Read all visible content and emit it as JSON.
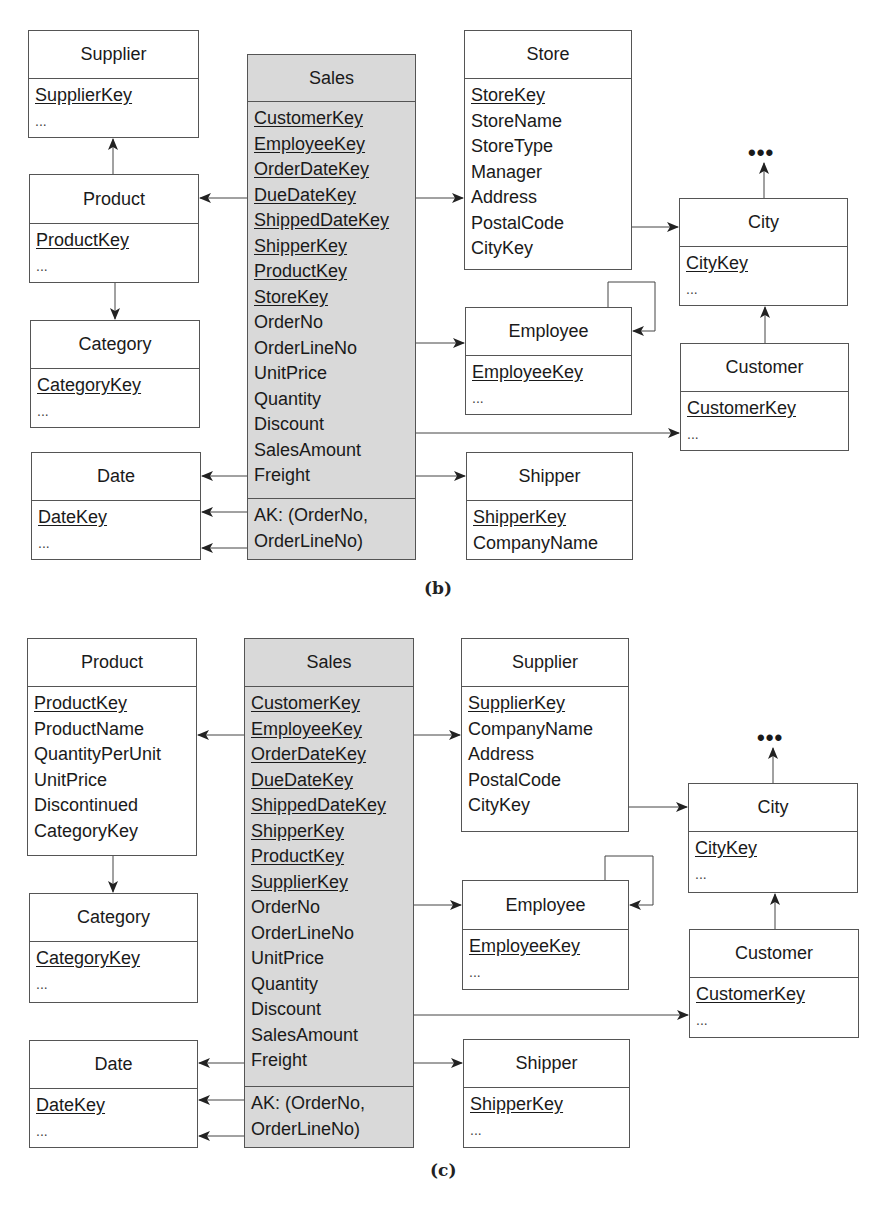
{
  "diagrams": {
    "b": {
      "caption": "(b)",
      "tables": {
        "supplier": {
          "name": "Supplier",
          "attributes": [
            {
              "text": "SupplierKey",
              "key": true
            },
            {
              "text": "...",
              "key": false
            }
          ]
        },
        "product": {
          "name": "Product",
          "attributes": [
            {
              "text": "ProductKey",
              "key": true
            },
            {
              "text": "...",
              "key": false
            }
          ]
        },
        "category": {
          "name": "Category",
          "attributes": [
            {
              "text": "CategoryKey",
              "key": true
            },
            {
              "text": "...",
              "key": false
            }
          ]
        },
        "date": {
          "name": "Date",
          "attributes": [
            {
              "text": "DateKey",
              "key": true
            },
            {
              "text": "...",
              "key": false
            }
          ]
        },
        "sales": {
          "name": "Sales",
          "attributes": [
            {
              "text": "CustomerKey",
              "key": true
            },
            {
              "text": "EmployeeKey",
              "key": true
            },
            {
              "text": "OrderDateKey",
              "key": true
            },
            {
              "text": "DueDateKey",
              "key": true
            },
            {
              "text": "ShippedDateKey",
              "key": true
            },
            {
              "text": "ShipperKey",
              "key": true
            },
            {
              "text": "ProductKey",
              "key": true
            },
            {
              "text": "StoreKey",
              "key": true
            },
            {
              "text": "OrderNo",
              "key": false
            },
            {
              "text": "OrderLineNo",
              "key": false
            },
            {
              "text": "UnitPrice",
              "key": false
            },
            {
              "text": "Quantity",
              "key": false
            },
            {
              "text": "Discount",
              "key": false
            },
            {
              "text": "SalesAmount",
              "key": false
            },
            {
              "text": "Freight",
              "key": false
            }
          ],
          "alternate_key": [
            "AK: (OrderNo,",
            "OrderLineNo)"
          ]
        },
        "store": {
          "name": "Store",
          "attributes": [
            {
              "text": "StoreKey",
              "key": true
            },
            {
              "text": "StoreName",
              "key": false
            },
            {
              "text": "StoreType",
              "key": false
            },
            {
              "text": "Manager",
              "key": false
            },
            {
              "text": "Address",
              "key": false
            },
            {
              "text": "PostalCode",
              "key": false
            },
            {
              "text": "CityKey",
              "key": false
            }
          ]
        },
        "city": {
          "name": "City",
          "attributes": [
            {
              "text": "CityKey",
              "key": true
            },
            {
              "text": "...",
              "key": false
            }
          ]
        },
        "employee": {
          "name": "Employee",
          "attributes": [
            {
              "text": "EmployeeKey",
              "key": true
            },
            {
              "text": "...",
              "key": false
            }
          ]
        },
        "customer": {
          "name": "Customer",
          "attributes": [
            {
              "text": "CustomerKey",
              "key": true
            },
            {
              "text": "...",
              "key": false
            }
          ]
        },
        "shipper": {
          "name": "Shipper",
          "attributes": [
            {
              "text": "ShipperKey",
              "key": true
            },
            {
              "text": "CompanyName",
              "key": false
            }
          ]
        }
      },
      "continuation": "•••"
    },
    "c": {
      "caption": "(c)",
      "tables": {
        "product": {
          "name": "Product",
          "attributes": [
            {
              "text": "ProductKey",
              "key": true
            },
            {
              "text": "ProductName",
              "key": false
            },
            {
              "text": "QuantityPerUnit",
              "key": false
            },
            {
              "text": "UnitPrice",
              "key": false
            },
            {
              "text": "Discontinued",
              "key": false
            },
            {
              "text": "CategoryKey",
              "key": false
            }
          ]
        },
        "category": {
          "name": "Category",
          "attributes": [
            {
              "text": "CategoryKey",
              "key": true
            },
            {
              "text": "...",
              "key": false
            }
          ]
        },
        "date": {
          "name": "Date",
          "attributes": [
            {
              "text": "DateKey",
              "key": true
            },
            {
              "text": "...",
              "key": false
            }
          ]
        },
        "sales": {
          "name": "Sales",
          "attributes": [
            {
              "text": "CustomerKey",
              "key": true
            },
            {
              "text": "EmployeeKey",
              "key": true
            },
            {
              "text": "OrderDateKey",
              "key": true
            },
            {
              "text": "DueDateKey",
              "key": true
            },
            {
              "text": "ShippedDateKey",
              "key": true
            },
            {
              "text": "ShipperKey",
              "key": true
            },
            {
              "text": "ProductKey",
              "key": true
            },
            {
              "text": "SupplierKey",
              "key": true
            },
            {
              "text": "OrderNo",
              "key": false
            },
            {
              "text": "OrderLineNo",
              "key": false
            },
            {
              "text": "UnitPrice",
              "key": false
            },
            {
              "text": "Quantity",
              "key": false
            },
            {
              "text": "Discount",
              "key": false
            },
            {
              "text": "SalesAmount",
              "key": false
            },
            {
              "text": "Freight",
              "key": false
            }
          ],
          "alternate_key": [
            "AK: (OrderNo,",
            "OrderLineNo)"
          ]
        },
        "supplier": {
          "name": "Supplier",
          "attributes": [
            {
              "text": "SupplierKey",
              "key": true
            },
            {
              "text": "CompanyName",
              "key": false
            },
            {
              "text": "Address",
              "key": false
            },
            {
              "text": "PostalCode",
              "key": false
            },
            {
              "text": "CityKey",
              "key": false
            }
          ]
        },
        "city": {
          "name": "City",
          "attributes": [
            {
              "text": "CityKey",
              "key": true
            },
            {
              "text": "...",
              "key": false
            }
          ]
        },
        "employee": {
          "name": "Employee",
          "attributes": [
            {
              "text": "EmployeeKey",
              "key": true
            },
            {
              "text": "...",
              "key": false
            }
          ]
        },
        "customer": {
          "name": "Customer",
          "attributes": [
            {
              "text": "CustomerKey",
              "key": true
            },
            {
              "text": "...",
              "key": false
            }
          ]
        },
        "shipper": {
          "name": "Shipper",
          "attributes": [
            {
              "text": "ShipperKey",
              "key": true
            },
            {
              "text": "...",
              "key": false
            }
          ]
        }
      },
      "continuation": "•••"
    }
  },
  "colors": {
    "fact_fill": "#d9d9d9",
    "dimension_fill": "#ffffff",
    "border": "#555555"
  }
}
